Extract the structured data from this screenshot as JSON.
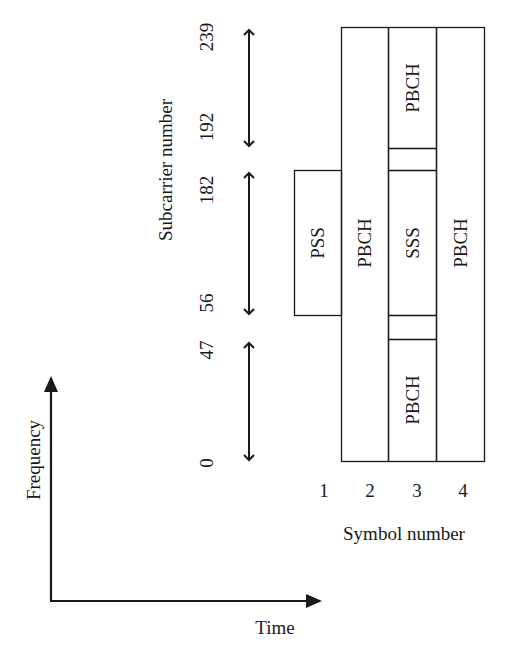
{
  "diagram": {
    "y_axis_label": "Subcarrier number",
    "x_axis_label": "Symbol number",
    "subcarrier_ticks": [
      "0",
      "47",
      "56",
      "182",
      "192",
      "239"
    ],
    "symbol_ticks": [
      "1",
      "2",
      "3",
      "4"
    ],
    "blocks": {
      "pss": "PSS",
      "pbch_symbol2": "PBCH",
      "pbch_symbol3_top": "PBCH",
      "sss": "SSS",
      "pbch_symbol3_bottom": "PBCH",
      "pbch_symbol4": "PBCH"
    },
    "axes": {
      "frequency_label": "Frequency",
      "time_label": "Time"
    },
    "colors": {
      "line": "#1a1a1a",
      "background": "#ffffff"
    }
  }
}
